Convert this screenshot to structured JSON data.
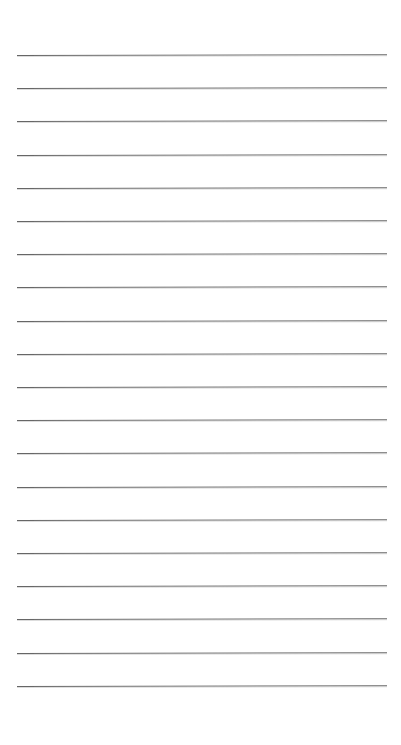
{
  "page": {
    "kind": "lined-paper-sheet",
    "width": 401,
    "height": 745,
    "background_color": "#ffffff",
    "title": "",
    "header_text": "",
    "footer_text": ""
  },
  "ruling": {
    "line_color": "#5a5a5a",
    "line_thickness_px": 1,
    "line_count": 20,
    "first_line_y": 55,
    "line_spacing_px": 33.2,
    "line_left_x": 17,
    "line_right_x": 387,
    "top_margin_px": 55,
    "bottom_margin_px": 59,
    "left_margin_px": 17,
    "right_margin_px": 14,
    "margin_rule_visible": false,
    "tilt_degrees": -0.13
  },
  "lines": [
    {
      "index": 1,
      "y": 55,
      "text": ""
    },
    {
      "index": 2,
      "y": 88.2,
      "text": ""
    },
    {
      "index": 3,
      "y": 121.4,
      "text": ""
    },
    {
      "index": 4,
      "y": 154.6,
      "text": ""
    },
    {
      "index": 5,
      "y": 187.8,
      "text": ""
    },
    {
      "index": 6,
      "y": 221.0,
      "text": ""
    },
    {
      "index": 7,
      "y": 254.2,
      "text": ""
    },
    {
      "index": 8,
      "y": 287.4,
      "text": ""
    },
    {
      "index": 9,
      "y": 320.6,
      "text": ""
    },
    {
      "index": 10,
      "y": 353.8,
      "text": ""
    },
    {
      "index": 11,
      "y": 387.0,
      "text": ""
    },
    {
      "index": 12,
      "y": 420.2,
      "text": ""
    },
    {
      "index": 13,
      "y": 453.4,
      "text": ""
    },
    {
      "index": 14,
      "y": 486.6,
      "text": ""
    },
    {
      "index": 15,
      "y": 519.8,
      "text": ""
    },
    {
      "index": 16,
      "y": 553.0,
      "text": ""
    },
    {
      "index": 17,
      "y": 586.2,
      "text": ""
    },
    {
      "index": 18,
      "y": 619.4,
      "text": ""
    },
    {
      "index": 19,
      "y": 652.6,
      "text": ""
    },
    {
      "index": 20,
      "y": 685.8,
      "text": ""
    }
  ]
}
